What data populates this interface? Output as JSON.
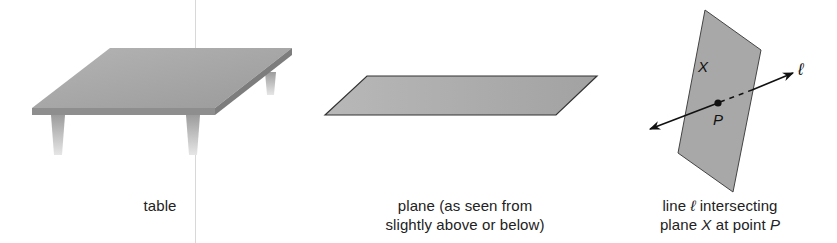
{
  "figures": [
    {
      "id": "table",
      "caption": "table"
    },
    {
      "id": "plane",
      "caption_line1": "plane (as seen from",
      "caption_line2": "slightly above or below)"
    },
    {
      "id": "line-intersecting-plane",
      "caption_line1_prefix": "line ",
      "caption_line1_symbol": "ℓ",
      "caption_line1_suffix": " intersecting",
      "caption_line2_prefix": "plane ",
      "caption_line2_plane": "X",
      "caption_line2_mid": " at point ",
      "caption_line2_point": "P",
      "labels": {
        "plane": "X",
        "point": "P",
        "line": "ℓ"
      }
    }
  ],
  "colors": {
    "surface": "#a9a9a9",
    "surface_dark": "#8f8f8f",
    "edge": "#333333",
    "text": "#222222"
  }
}
